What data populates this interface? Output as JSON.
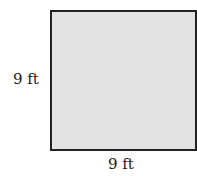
{
  "figure": {
    "shape": "square",
    "fill_color": "#e3e3e3",
    "border_color": "#222222",
    "side_label": "9 ft",
    "bottom_label": "9 ft"
  }
}
